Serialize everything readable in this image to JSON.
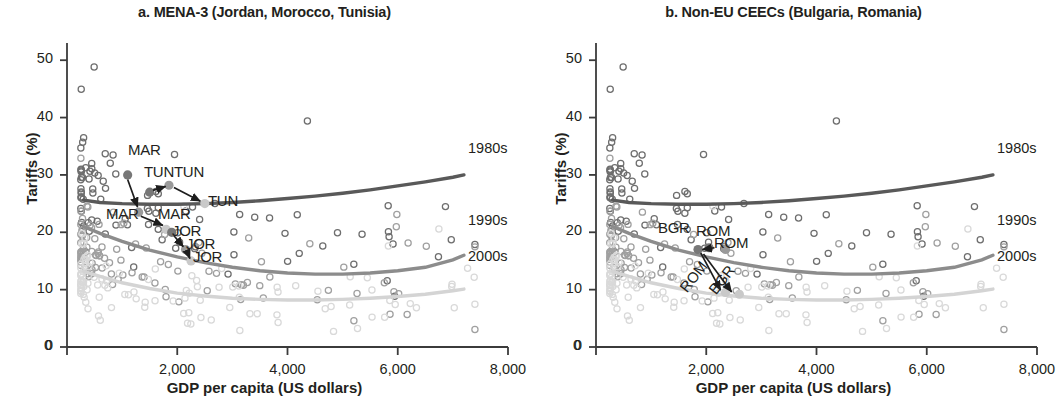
{
  "figure": {
    "axis_x_title": "GDP per capita (US dollars)",
    "axis_y_title": "Tariffs (%)",
    "x_ticks": [
      "0",
      "2,000",
      "4,000",
      "6,000",
      "8,000"
    ],
    "y_ticks": [
      "0",
      "10",
      "20",
      "30",
      "40",
      "50"
    ],
    "decade_labels": [
      "1980s",
      "1990s",
      "2000s"
    ],
    "colors": {
      "decade_1980s": "#595959",
      "decade_1990s": "#8c8c8c",
      "decade_2000s": "#d4d4d4",
      "scatter_1980s": "#6e6e6e",
      "scatter_1990s": "#a0a0a0",
      "scatter_2000s": "#d9d9d9",
      "axis": "#3b3b3b",
      "text": "#231f20",
      "highlight_dark": "#777777",
      "highlight_mid": "#9a9a9a",
      "highlight_light": "#c9c9c9"
    }
  },
  "chart_data": [
    {
      "type": "scatter",
      "panel": "a",
      "title": "a. MENA-3 (Jordan, Morocco, Tunisia)",
      "xlabel": "GDP per capita (US dollars)",
      "ylabel": "Tariffs (%)",
      "xlim": [
        0,
        8000
      ],
      "ylim": [
        0,
        53
      ],
      "grid": false,
      "legend_position": "right-inline",
      "series": [
        {
          "name": "1980s",
          "color": "#595959",
          "curve_x": [
            300,
            600,
            1000,
            1500,
            2000,
            2500,
            3000,
            3500,
            4000,
            4500,
            5000,
            5500,
            6000,
            6500,
            7000,
            7200
          ],
          "curve_y": [
            25.6,
            25.2,
            25.0,
            24.9,
            24.9,
            25.0,
            25.2,
            25.5,
            25.9,
            26.3,
            26.8,
            27.4,
            28.1,
            28.8,
            29.6,
            30.0
          ]
        },
        {
          "name": "1990s",
          "color": "#8c8c8c",
          "curve_x": [
            300,
            600,
            1000,
            1500,
            2000,
            2500,
            3000,
            3500,
            4000,
            4500,
            5000,
            5500,
            6000,
            6500,
            7000,
            7200
          ],
          "curve_y": [
            21.0,
            19.8,
            18.4,
            16.9,
            15.7,
            14.7,
            13.9,
            13.3,
            12.9,
            12.7,
            12.7,
            12.9,
            13.3,
            13.9,
            15.2,
            16.0
          ]
        },
        {
          "name": "2000s",
          "color": "#d4d4d4",
          "curve_x": [
            300,
            600,
            1000,
            1500,
            2000,
            2500,
            3000,
            3500,
            4000,
            4500,
            5000,
            5500,
            6000,
            6500,
            7000,
            7200
          ],
          "curve_y": [
            13.2,
            12.3,
            11.2,
            10.2,
            9.4,
            8.9,
            8.5,
            8.3,
            8.2,
            8.2,
            8.3,
            8.5,
            8.8,
            9.2,
            9.8,
            10.1
          ]
        }
      ],
      "annotations": [
        {
          "label": "MAR",
          "x": 1100,
          "y": 30.0,
          "role": "country-marker-1980s"
        },
        {
          "label": "TUN",
          "x": 1500,
          "y": 27.0,
          "role": "country-marker-1980s"
        },
        {
          "label": "TUN",
          "x": 1850,
          "y": 28.2,
          "role": "country-marker-1990s"
        },
        {
          "label": "TUN",
          "x": 2500,
          "y": 25.0,
          "role": "country-marker-2000s"
        },
        {
          "label": "MAR",
          "x": 1300,
          "y": 23.5,
          "role": "country-marker-1990s"
        },
        {
          "label": "MAR",
          "x": 1800,
          "y": 20.5,
          "role": "country-marker-2000s"
        },
        {
          "label": "JOR",
          "x": 1900,
          "y": 20.0,
          "role": "country-marker-1980s"
        },
        {
          "label": "JOR",
          "x": 2150,
          "y": 17.0,
          "role": "country-marker-1990s"
        },
        {
          "label": "JOR",
          "x": 2250,
          "y": 15.0,
          "role": "country-marker-2000s"
        }
      ],
      "scatter_note": "Dense cloud of hollow circles, heaviest below 1,500 US dollars, spanning 3-51% tariffs"
    },
    {
      "type": "scatter",
      "panel": "b",
      "title": "b. Non-EU CEECs (Bulgaria, Romania)",
      "xlabel": "GDP per capita (US dollars)",
      "ylabel": "Tariffs (%)",
      "xlim": [
        0,
        8000
      ],
      "ylim": [
        0,
        53
      ],
      "grid": false,
      "legend_position": "right-inline",
      "series": [
        {
          "name": "1980s",
          "color": "#595959",
          "curve_x": [
            300,
            600,
            1000,
            1500,
            2000,
            2500,
            3000,
            3500,
            4000,
            4500,
            5000,
            5500,
            6000,
            6500,
            7000,
            7200
          ],
          "curve_y": [
            25.6,
            25.2,
            25.0,
            24.9,
            24.9,
            25.0,
            25.2,
            25.5,
            25.9,
            26.3,
            26.8,
            27.4,
            28.1,
            28.8,
            29.6,
            30.0
          ]
        },
        {
          "name": "1990s",
          "color": "#8c8c8c",
          "curve_x": [
            300,
            600,
            1000,
            1500,
            2000,
            2500,
            3000,
            3500,
            4000,
            4500,
            5000,
            5500,
            6000,
            6500,
            7000,
            7200
          ],
          "curve_y": [
            21.0,
            19.8,
            18.4,
            16.9,
            15.7,
            14.7,
            13.9,
            13.3,
            12.9,
            12.7,
            12.7,
            12.9,
            13.3,
            13.9,
            15.2,
            16.0
          ]
        },
        {
          "name": "2000s",
          "color": "#d4d4d4",
          "curve_x": [
            300,
            600,
            1000,
            1500,
            2000,
            2500,
            3000,
            3500,
            4000,
            4500,
            5000,
            5500,
            6000,
            6500,
            7000,
            7200
          ],
          "curve_y": [
            13.2,
            12.3,
            11.2,
            10.2,
            9.4,
            8.9,
            8.5,
            8.3,
            8.2,
            8.2,
            8.3,
            8.5,
            8.8,
            9.2,
            9.8,
            10.1
          ]
        }
      ],
      "annotations": [
        {
          "label": "BGR",
          "x": 1850,
          "y": 17.0,
          "role": "country-marker-1980s"
        },
        {
          "label": "ROM",
          "x": 2050,
          "y": 17.3,
          "role": "country-marker-1980s"
        },
        {
          "label": "ROM",
          "x": 2350,
          "y": 17.0,
          "role": "country-marker-1990s"
        },
        {
          "label": "ROM",
          "x": 2350,
          "y": 9.5,
          "role": "country-marker-2000s"
        },
        {
          "label": "BGR",
          "x": 2600,
          "y": 9.2,
          "role": "country-marker-2000s"
        }
      ],
      "scatter_note": "Dense cloud of hollow circles, heaviest below 1,500 US dollars, spanning 3-51% tariffs"
    }
  ]
}
